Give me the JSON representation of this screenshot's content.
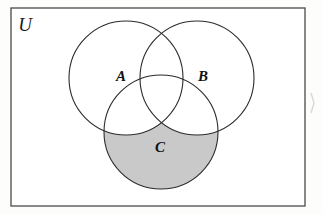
{
  "figure": {
    "name": "venn-diagram-three-sets",
    "background_color": "#fdfdfc",
    "universe": {
      "label": "U",
      "border_color": "#4a4a4a",
      "fill_color": "#ffffff",
      "x": 11,
      "y": 8,
      "width": 294,
      "height": 198,
      "label_x": 25,
      "label_y": 31
    },
    "stroke_color": "#2b2b2b",
    "stroke_width": 1.1,
    "shading": {
      "region_description": "C minus (A union B)",
      "fill_color": "#c9c9c9"
    },
    "circles": [
      {
        "label": "A",
        "cx": 126,
        "cy": 78,
        "r": 57,
        "label_x": 121,
        "label_y": 81
      },
      {
        "label": "B",
        "cx": 197,
        "cy": 78,
        "r": 57,
        "label_x": 203,
        "label_y": 81
      },
      {
        "label": "C",
        "cx": 161,
        "cy": 132,
        "r": 57,
        "label_x": 160,
        "label_y": 152
      }
    ],
    "artifact": {
      "name": "scan-artifact-mark",
      "x": 310,
      "y": 92,
      "width": 6,
      "height": 22,
      "color": "#d8d8d8"
    }
  }
}
